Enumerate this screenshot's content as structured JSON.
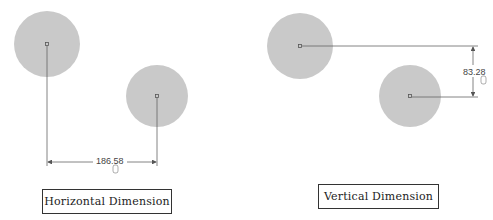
{
  "colors": {
    "circle_fill": "#c9c9c9",
    "line": "#555555",
    "text": "#222222"
  },
  "horizontal": {
    "caption": "Horizontal Dimension",
    "value": "186.58",
    "circles": [
      {
        "cx": 47,
        "cy": 44,
        "r": 33
      },
      {
        "cx": 157,
        "cy": 96,
        "r": 31
      }
    ]
  },
  "vertical": {
    "caption": "Vertical Dimension",
    "value": "83.28",
    "circles": [
      {
        "cx": 300,
        "cy": 46,
        "r": 33
      },
      {
        "cx": 410,
        "cy": 96,
        "r": 31
      }
    ]
  }
}
